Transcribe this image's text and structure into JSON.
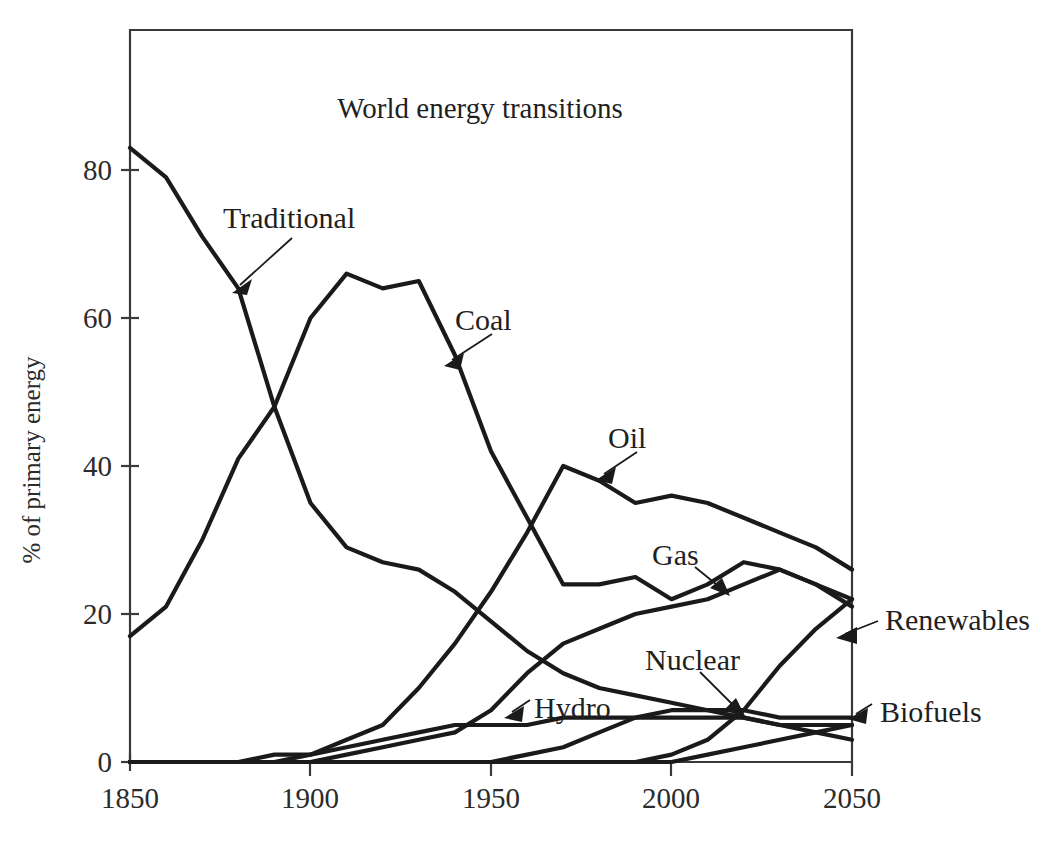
{
  "figure": {
    "background_color": "#ffffff",
    "line_color": "#1a1a1a",
    "axis_color": "#3a3a3a"
  },
  "chart_data": {
    "type": "line",
    "title": "World energy transitions",
    "xlabel": "",
    "ylabel": "% of primary energy",
    "xlim": [
      1850,
      2050
    ],
    "ylim": [
      0,
      90
    ],
    "xticks": [
      1850,
      1900,
      1950,
      2000,
      2050
    ],
    "xtick_labels": [
      "1850",
      "1900",
      "1950",
      "2000",
      "2050"
    ],
    "yticks": [
      0,
      20,
      40,
      60,
      80
    ],
    "ytick_labels": [
      "0",
      "20",
      "40",
      "60",
      "80"
    ],
    "grid": false,
    "legend": "inline annotations with leader arrows",
    "x": [
      1850,
      1860,
      1870,
      1880,
      1890,
      1900,
      1910,
      1920,
      1930,
      1940,
      1950,
      1960,
      1970,
      1980,
      1990,
      2000,
      2010,
      2020,
      2030,
      2040,
      2050
    ],
    "series": [
      {
        "name": "Traditional",
        "values": [
          83,
          79,
          71,
          64,
          48,
          35,
          29,
          27,
          26,
          23,
          19,
          15,
          12,
          10,
          9,
          8,
          7,
          6,
          5,
          4,
          3
        ],
        "label_text": "Traditional"
      },
      {
        "name": "Coal",
        "values": [
          17,
          21,
          30,
          41,
          48,
          60,
          66,
          64,
          65,
          55,
          42,
          33,
          24,
          24,
          25,
          22,
          24,
          27,
          26,
          24,
          22
        ],
        "label_text": "Coal"
      },
      {
        "name": "Oil",
        "values": [
          0,
          0,
          0,
          0,
          1,
          1,
          3,
          5,
          10,
          16,
          23,
          31,
          40,
          38,
          35,
          36,
          35,
          33,
          31,
          29,
          26
        ],
        "label_text": "Oil"
      },
      {
        "name": "Gas",
        "values": [
          0,
          0,
          0,
          0,
          0,
          0,
          1,
          2,
          3,
          4,
          7,
          12,
          16,
          18,
          20,
          21,
          22,
          24,
          26,
          24,
          21
        ],
        "label_text": "Gas"
      },
      {
        "name": "Hydro",
        "values": [
          0,
          0,
          0,
          0,
          0,
          1,
          2,
          3,
          4,
          5,
          5,
          5,
          6,
          6,
          6,
          7,
          7,
          7,
          6,
          6,
          6
        ],
        "label_text": "Hydro"
      },
      {
        "name": "Nuclear",
        "values": [
          0,
          0,
          0,
          0,
          0,
          0,
          0,
          0,
          0,
          0,
          0,
          1,
          2,
          4,
          6,
          6,
          6,
          6,
          5,
          5,
          5
        ],
        "label_text": "Nuclear"
      },
      {
        "name": "Renewables",
        "values": [
          0,
          0,
          0,
          0,
          0,
          0,
          0,
          0,
          0,
          0,
          0,
          0,
          0,
          0,
          0,
          1,
          3,
          7,
          13,
          18,
          22
        ],
        "label_text": "Renewables"
      },
      {
        "name": "Biofuels",
        "values": [
          0,
          0,
          0,
          0,
          0,
          0,
          0,
          0,
          0,
          0,
          0,
          0,
          0,
          0,
          0,
          0,
          1,
          2,
          3,
          4,
          5
        ],
        "label_text": "Biofuels"
      }
    ]
  },
  "annotations": {
    "traditional": "Traditional",
    "coal": "Coal",
    "oil": "Oil",
    "gas": "Gas",
    "nuclear": "Nuclear",
    "hydro": "Hydro",
    "renewables": "Renewables",
    "biofuels": "Biofuels"
  },
  "axes": {
    "y_title": "% of primary energy",
    "x_tick_0": "1850",
    "x_tick_1": "1900",
    "x_tick_2": "1950",
    "x_tick_3": "2000",
    "x_tick_4": "2050",
    "y_tick_0": "0",
    "y_tick_1": "20",
    "y_tick_2": "40",
    "y_tick_3": "60",
    "y_tick_4": "80"
  }
}
